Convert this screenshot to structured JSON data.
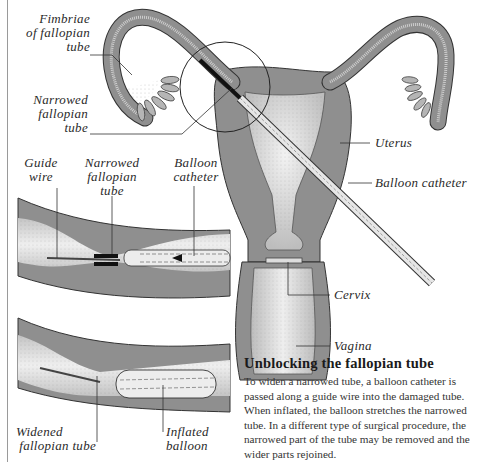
{
  "diagram": {
    "labels": {
      "fimbriae": "Fimbriae of fallopian tube",
      "fimbriae_l1": "Fimbriae",
      "fimbriae_l2": "of fallopian",
      "fimbriae_l3": "tube",
      "narrowed_main_l1": "Narrowed",
      "narrowed_main_l2": "fallopian",
      "narrowed_main_l3": "tube",
      "uterus": "Uterus",
      "balloon_catheter_main": "Balloon catheter",
      "cervix": "Cervix",
      "vagina": "Vagina",
      "guide_wire_l1": "Guide",
      "guide_wire_l2": "wire",
      "narrowed_inset_l1": "Narrowed",
      "narrowed_inset_l2": "fallopian",
      "narrowed_inset_l3": "tube",
      "balloon_catheter_inset_l1": "Balloon",
      "balloon_catheter_inset_l2": "catheter",
      "widened_l1": "Widened",
      "widened_l2": "fallopian tube",
      "inflated_l1": "Inflated",
      "inflated_l2": "balloon"
    },
    "caption": {
      "title": "Unblocking the fallopian tube",
      "body": "To widen a narrowed tube, a balloon catheter is passed along a guide wire into the damaged tube. When inflated, the balloon stretches the narrowed tube. In a different type of surgical procedure, the narrowed part of the tube may be removed and the wider parts rejoined."
    },
    "colors": {
      "tissue_dark": "#8c8c8c",
      "tissue_mid": "#a8a8a8",
      "tissue_light": "#d8d8d8",
      "outline": "#333333",
      "catheter_black": "#111111"
    }
  }
}
